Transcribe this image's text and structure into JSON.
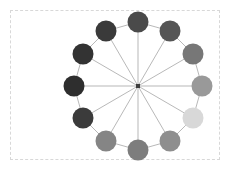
{
  "figure": {
    "width": 230,
    "height": 170,
    "background_color": "#ffffff",
    "title": ""
  },
  "axes": {
    "frame_style": "dashed",
    "frame_color": "#d8d8d8",
    "left": 10,
    "top": 10,
    "width": 210,
    "height": 150,
    "show_ticks": false,
    "show_labels": false
  },
  "chart_data": {
    "type": "scatter",
    "title": "",
    "xlabel": "",
    "ylabel": "",
    "subtitle": "",
    "graph_type": "wheel-graph",
    "node_count": 13,
    "rim_node_count": 12,
    "layout": "circular-with-hub",
    "center": {
      "x": 138,
      "y": 86
    },
    "ring_radius": 64,
    "node_radius": 10.5,
    "hub_radius": 2,
    "hub_color": "#3c3c3c",
    "colormap": "Greys_r",
    "edge_color": "#9a9a9a",
    "edge_width": 0.7,
    "legend_position": "none",
    "grid": false,
    "nodes": [
      {
        "id": 0,
        "label": "0",
        "angle_deg": 90,
        "x": 138,
        "y": 22,
        "color": "#4a4a4a",
        "value": 0.29
      },
      {
        "id": 1,
        "label": "1",
        "angle_deg": 60,
        "x": 170,
        "y": 31,
        "color": "#555555",
        "value": 0.33
      },
      {
        "id": 2,
        "label": "2",
        "angle_deg": 30,
        "x": 193,
        "y": 54,
        "color": "#777777",
        "value": 0.47
      },
      {
        "id": 3,
        "label": "3",
        "angle_deg": 0,
        "x": 202,
        "y": 86,
        "color": "#999999",
        "value": 0.6
      },
      {
        "id": 4,
        "label": "4",
        "angle_deg": 330,
        "x": 193,
        "y": 118,
        "color": "#d8d8d8",
        "value": 0.85
      },
      {
        "id": 5,
        "label": "5",
        "angle_deg": 300,
        "x": 170,
        "y": 141,
        "color": "#8e8e8e",
        "value": 0.56
      },
      {
        "id": 6,
        "label": "6",
        "angle_deg": 270,
        "x": 138,
        "y": 150,
        "color": "#7d7d7d",
        "value": 0.49
      },
      {
        "id": 7,
        "label": "7",
        "angle_deg": 240,
        "x": 106,
        "y": 141,
        "color": "#858585",
        "value": 0.52
      },
      {
        "id": 8,
        "label": "8",
        "angle_deg": 210,
        "x": 83,
        "y": 118,
        "color": "#3b3b3b",
        "value": 0.23
      },
      {
        "id": 9,
        "label": "9",
        "angle_deg": 180,
        "x": 74,
        "y": 86,
        "color": "#2e2e2e",
        "value": 0.18
      },
      {
        "id": 10,
        "label": "10",
        "angle_deg": 150,
        "x": 83,
        "y": 54,
        "color": "#333333",
        "value": 0.2
      },
      {
        "id": 11,
        "label": "11",
        "angle_deg": 120,
        "x": 106,
        "y": 31,
        "color": "#3a3a3a",
        "value": 0.23
      },
      {
        "id": 12,
        "label": "hub",
        "angle_deg": 0,
        "x": 138,
        "y": 86,
        "color": "#3c3c3c",
        "value": 0.0
      }
    ],
    "edges": [
      {
        "source": 12,
        "target": 0
      },
      {
        "source": 12,
        "target": 1
      },
      {
        "source": 12,
        "target": 2
      },
      {
        "source": 12,
        "target": 3
      },
      {
        "source": 12,
        "target": 4
      },
      {
        "source": 12,
        "target": 5
      },
      {
        "source": 12,
        "target": 6
      },
      {
        "source": 12,
        "target": 7
      },
      {
        "source": 12,
        "target": 8
      },
      {
        "source": 12,
        "target": 9
      },
      {
        "source": 12,
        "target": 10
      },
      {
        "source": 12,
        "target": 11
      },
      {
        "source": 0,
        "target": 1
      },
      {
        "source": 1,
        "target": 2
      },
      {
        "source": 2,
        "target": 3
      },
      {
        "source": 3,
        "target": 4
      },
      {
        "source": 4,
        "target": 5
      },
      {
        "source": 5,
        "target": 6
      },
      {
        "source": 6,
        "target": 7
      },
      {
        "source": 7,
        "target": 8
      },
      {
        "source": 8,
        "target": 9
      },
      {
        "source": 9,
        "target": 10
      },
      {
        "source": 10,
        "target": 11
      },
      {
        "source": 11,
        "target": 0
      }
    ]
  }
}
